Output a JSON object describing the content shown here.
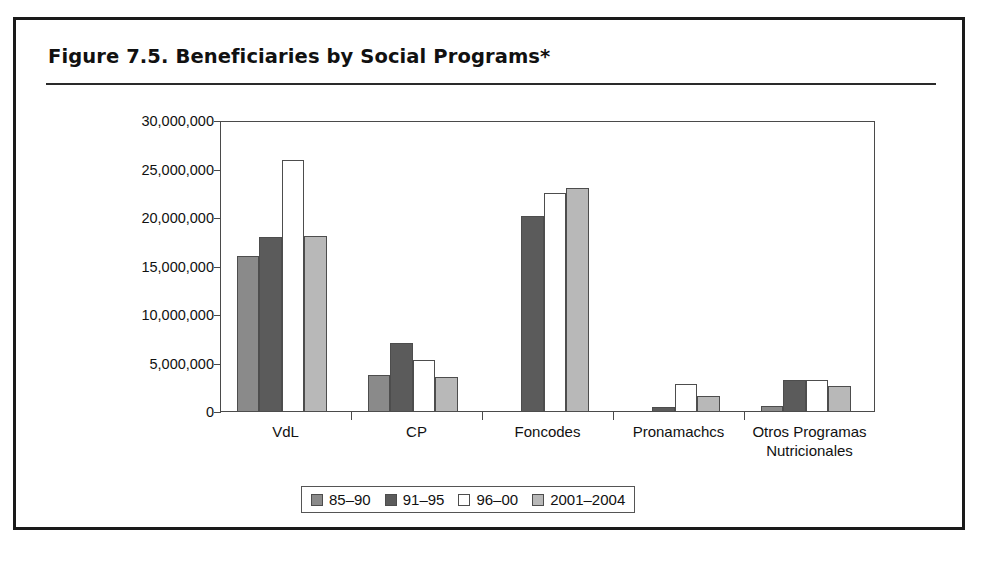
{
  "figure": {
    "title": "Figure 7.5.  Beneficiaries by Social Programs*"
  },
  "chart_data": {
    "type": "bar",
    "title": "Figure 7.5.  Beneficiaries by Social Programs*",
    "xlabel": "",
    "ylabel": "",
    "ylim": [
      0,
      30000000
    ],
    "ytick_values": [
      0,
      5000000,
      10000000,
      15000000,
      20000000,
      25000000,
      30000000
    ],
    "ytick_labels": [
      "0",
      "5,000,000",
      "10,000,000",
      "15,000,000",
      "20,000,000",
      "25,000,000",
      "30,000,000"
    ],
    "grid": false,
    "legend_position": "bottom-center",
    "categories": [
      "VdL",
      "CP",
      "Foncodes",
      "Pronamachcs",
      "Otros Programas Nutricionales"
    ],
    "category_label_lines": [
      [
        "VdL"
      ],
      [
        "CP"
      ],
      [
        "Foncodes"
      ],
      [
        "Pronamachcs"
      ],
      [
        "Otros Programas",
        "Nutricionales"
      ]
    ],
    "series": [
      {
        "name": "85–90",
        "color": "#8a8a8a",
        "values": [
          16100000,
          3800000,
          0,
          0,
          600000
        ]
      },
      {
        "name": "91–95",
        "color": "#5b5b5b",
        "values": [
          18000000,
          7100000,
          20200000,
          500000,
          3300000
        ]
      },
      {
        "name": "96–00",
        "color": "#ffffff",
        "values": [
          26000000,
          5400000,
          22600000,
          2900000,
          3300000
        ]
      },
      {
        "name": "2001–2004",
        "color": "#b8b8b8",
        "values": [
          18100000,
          3600000,
          23100000,
          1600000,
          2700000
        ]
      }
    ]
  }
}
